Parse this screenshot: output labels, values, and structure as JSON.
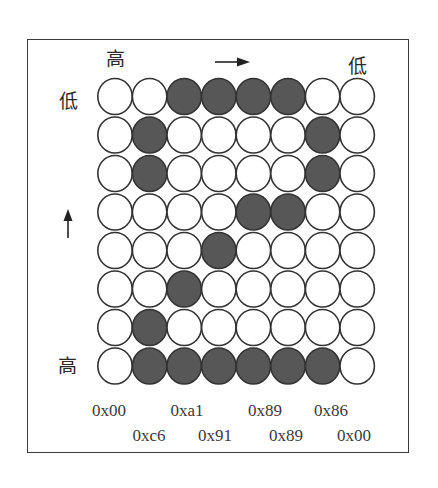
{
  "diagram": {
    "top_high_label": "高",
    "top_low_label": "低",
    "left_low_label": "低",
    "left_high_label": "高",
    "horizontal_arrow": "right-arrow",
    "vertical_arrow": "up-arrow",
    "fill_color": "#575757",
    "stroke_color": "#333333",
    "empty_color": "#ffffff",
    "grid": [
      [
        0,
        0,
        1,
        1,
        1,
        1,
        0,
        0
      ],
      [
        0,
        1,
        0,
        0,
        0,
        0,
        1,
        0
      ],
      [
        0,
        1,
        0,
        0,
        0,
        0,
        1,
        0
      ],
      [
        0,
        0,
        0,
        0,
        1,
        1,
        0,
        0
      ],
      [
        0,
        0,
        0,
        1,
        0,
        0,
        0,
        0
      ],
      [
        0,
        0,
        1,
        0,
        0,
        0,
        0,
        0
      ],
      [
        0,
        1,
        0,
        0,
        0,
        0,
        0,
        0
      ],
      [
        0,
        1,
        1,
        1,
        1,
        1,
        1,
        0
      ]
    ],
    "column_bytes": [
      "0x00",
      "0xc6",
      "0xa1",
      "0x91",
      "0x89",
      "0x89",
      "0x86",
      "0x00"
    ]
  },
  "hex_labels": {
    "row1": [
      "0x00",
      "0xa1",
      "0x89",
      "0x86"
    ],
    "row2": [
      "0xc6",
      "0x91",
      "0x89",
      "0x00"
    ]
  }
}
